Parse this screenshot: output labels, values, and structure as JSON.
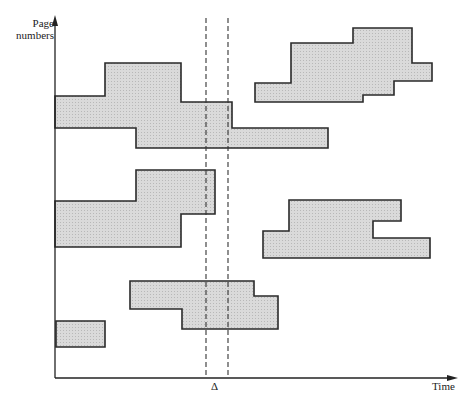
{
  "diagram": {
    "title": "",
    "axes": {
      "y_label_line1": "Page",
      "y_label_line2": "numbers",
      "x_label": "Time",
      "origin": [
        55,
        378
      ],
      "y_top": 15,
      "x_end": 458
    },
    "delta_marker": {
      "label": "Δ",
      "x_left": 206,
      "x_right": 228,
      "y_top": 18,
      "y_bottom": 378
    },
    "colors": {
      "fill": "#d4d4d4",
      "stroke": "#2a2a2a",
      "axis": "#222222"
    },
    "regions": [
      {
        "name": "locality-1",
        "points": "55,96 105,96 105,63 181,63 181,102 232,102 232,128 328,128 328,148 136,148 136,128 55,128"
      },
      {
        "name": "locality-2",
        "points": "255,83 291,83 291,43 353,43 353,28 412,28 412,63 432,63 432,81 394,81 394,95 363,95 363,102 255,102"
      },
      {
        "name": "locality-3",
        "points": "55,201 136,201 136,170 215,170 215,214 181,214 181,247 55,247"
      },
      {
        "name": "locality-4",
        "points": "263,231 289,231 289,200 401,200 401,221 373,221 373,238 430,238 430,258 263,258"
      },
      {
        "name": "locality-5",
        "points": "130,281 254,281 254,296 278,296 278,329 182,329 182,309 130,309"
      },
      {
        "name": "locality-6",
        "points": "56,321 105,321 105,347 56,347"
      }
    ]
  }
}
